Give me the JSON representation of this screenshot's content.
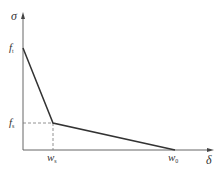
{
  "diagram": {
    "type": "bilinear softening stress-crack opening curve",
    "axes": {
      "y_label": "σ",
      "x_label": "δ"
    },
    "ticks": {
      "y": [
        {
          "base": "f",
          "sub": "t"
        },
        {
          "base": "f",
          "sub": "s"
        }
      ],
      "x": [
        {
          "base": "w",
          "sub": "s"
        },
        {
          "base": "w",
          "sub": "0"
        }
      ]
    },
    "points": [
      {
        "name": "peak",
        "x": 0,
        "y": "f_t"
      },
      {
        "name": "knee",
        "x": "w_s",
        "y": "f_s"
      },
      {
        "name": "end",
        "x": "w_0",
        "y": 0
      }
    ],
    "colors": {
      "curve": "#333333",
      "axes": "#555555",
      "dashed": "#777777",
      "text": "#333333"
    }
  }
}
